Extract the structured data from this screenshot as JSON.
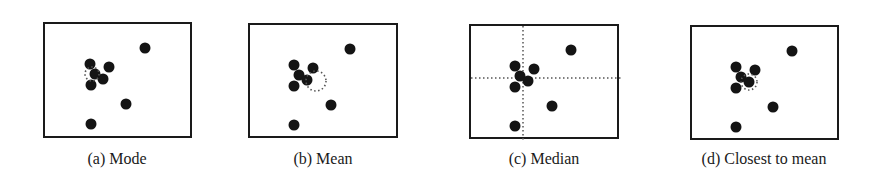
{
  "figure": {
    "colors": {
      "point": "#141414",
      "border": "#1a1a1a",
      "marker": "#555555"
    },
    "point_radius": 5.5,
    "panels": [
      {
        "id": "a",
        "caption": "(a) Mode",
        "box": {
          "x": 43,
          "y": 22,
          "w": 149,
          "h": 116
        },
        "caption_pos": {
          "cx": 117,
          "y": 150
        },
        "points": [
          [
            45,
            40
          ],
          [
            50,
            50
          ],
          [
            64,
            43
          ],
          [
            58,
            55
          ],
          [
            46,
            61
          ],
          [
            100,
            24
          ],
          [
            81,
            80
          ],
          [
            46,
            100
          ]
        ],
        "marker": {
          "type": "dotted-circle",
          "cx": 47,
          "cy": 50,
          "r": 7
        }
      },
      {
        "id": "b",
        "caption": "(b) Mean",
        "box": {
          "x": 248,
          "y": 23,
          "w": 150,
          "h": 115
        },
        "caption_pos": {
          "cx": 323,
          "y": 150
        },
        "points": [
          [
            44,
            40
          ],
          [
            49,
            50
          ],
          [
            63,
            43
          ],
          [
            57,
            55
          ],
          [
            44,
            61
          ],
          [
            100,
            24
          ],
          [
            81,
            80
          ],
          [
            44,
            100
          ]
        ],
        "marker": {
          "type": "dotted-circle",
          "cx": 66,
          "cy": 56,
          "r": 10
        }
      },
      {
        "id": "c",
        "caption": "(c) Median",
        "box": {
          "x": 469,
          "y": 24,
          "w": 150,
          "h": 115
        },
        "caption_pos": {
          "cx": 544,
          "y": 150
        },
        "points": [
          [
            44,
            40
          ],
          [
            49,
            50
          ],
          [
            63,
            43
          ],
          [
            57,
            55
          ],
          [
            44,
            61
          ],
          [
            100,
            24
          ],
          [
            81,
            80
          ],
          [
            44,
            100
          ]
        ],
        "marker": {
          "type": "crosshair",
          "vx": 52,
          "hy": 52
        }
      },
      {
        "id": "d",
        "caption": "(d) Closest to mean",
        "box": {
          "x": 690,
          "y": 25,
          "w": 149,
          "h": 115
        },
        "caption_pos": {
          "cx": 764,
          "y": 150
        },
        "points": [
          [
            44,
            40
          ],
          [
            49,
            50
          ],
          [
            63,
            43
          ],
          [
            57,
            55
          ],
          [
            44,
            61
          ],
          [
            100,
            24
          ],
          [
            81,
            80
          ],
          [
            44,
            100
          ]
        ],
        "marker": {
          "type": "dotted-circle",
          "cx": 57,
          "cy": 55,
          "r": 8
        }
      }
    ]
  }
}
